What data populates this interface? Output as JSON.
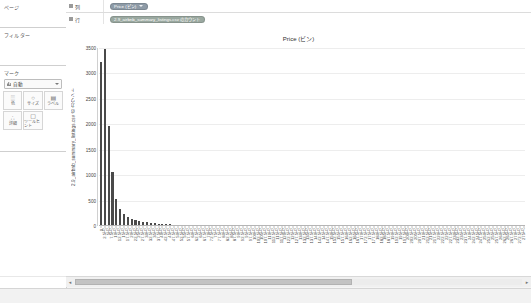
{
  "panels": {
    "pages": {
      "title": "ページ"
    },
    "filters": {
      "title": "フィルター"
    },
    "marks": {
      "title": "マーク",
      "type_label": "自動",
      "type_icon": "bar-mark-icon",
      "buttons": [
        {
          "icon": "color-icon",
          "glyph": "░",
          "label": "色"
        },
        {
          "icon": "size-icon",
          "glyph": "○",
          "label": "サイズ"
        },
        {
          "icon": "label-icon",
          "glyph": "▤",
          "label": "ラベル"
        },
        {
          "icon": "detail-icon",
          "glyph": "∴",
          "label": "詳細"
        },
        {
          "icon": "tooltip-icon",
          "glyph": "▢",
          "label": "ツールヒント"
        }
      ]
    }
  },
  "shelves": [
    {
      "name": "columns",
      "label": "列",
      "icon": "columns-icon",
      "pill": {
        "text": "Price (ビン)",
        "kind": "dim",
        "has_caret": true
      }
    },
    {
      "name": "rows",
      "label": "行",
      "icon": "rows-icon",
      "pill": {
        "text": "2.9_airbnb_summary_listings.csv のカウント",
        "kind": "mea",
        "has_caret": false
      }
    }
  ],
  "chart_data": {
    "type": "bar",
    "title": "Price (ビン)",
    "xlabel": "",
    "ylabel": "2.9_airbnb_summary_listings.csv のカウント",
    "ylim": [
      0,
      3500
    ],
    "yticks": [
      3500,
      3000,
      2500,
      2000,
      1500,
      1000,
      500,
      0
    ],
    "grid": true,
    "legend": null,
    "categories": [
      "0",
      "2.5万",
      "5万",
      "7.5万",
      "10万",
      "12.5万",
      "15万",
      "17.5万",
      "20万",
      "22.5万",
      "25万",
      "27.5万",
      "30万",
      "32.5万",
      "35万",
      "37.5万",
      "40万",
      "42.5万",
      "45万",
      "47.5万",
      "50万",
      "52.5万",
      "55万",
      "57.5万",
      "60万",
      "62.5万",
      "65万",
      "67.5万",
      "70万",
      "72.5万",
      "75万",
      "77.5万",
      "80万",
      "82.5万",
      "85万",
      "87.5万",
      "90万",
      "92.5万",
      "95万",
      "97.5万",
      "100万",
      "102.5万",
      "105万",
      "107.5万",
      "110万",
      "112.5万",
      "115万",
      "117.5万",
      "120万",
      "122.5万",
      "125万",
      "127.5万",
      "130万",
      "132.5万",
      "135万",
      "137.5万",
      "140万",
      "142.5万",
      "145万",
      "147.5万",
      "150万",
      "152.5万",
      "155万",
      "157.5万",
      "160万",
      "162.5万",
      "165万",
      "167.5万",
      "170万",
      "172.5万",
      "175万",
      "177.5万",
      "180万",
      "182.5万",
      "185万",
      "187.5万",
      "190万",
      "192.5万",
      "195万",
      "197.5万",
      "200万",
      "202.5万",
      "205万",
      "207.5万",
      "210万",
      "212.5万",
      "215万",
      "217.5万",
      "220万",
      "222.5万",
      "225万",
      "227.5万",
      "230万",
      "232.5万",
      "235万",
      "237.5万",
      "240万",
      "242.5万",
      "245万",
      "247.5万",
      "250万",
      "252.5万",
      "255万",
      "257.5万",
      "260万",
      "262.5万",
      "265万",
      "267.5万",
      "270万",
      "272.5万",
      "275万"
    ],
    "xtick_labels": [
      "0",
      "2.5万",
      "5万",
      "7.5万",
      "10万",
      "12.5万",
      "15万",
      "17.5万",
      "20万",
      "22.5万",
      "25万",
      "27.5万",
      "30万",
      "32.5万",
      "35万",
      "37.5万",
      "40万",
      "42.5万",
      "45万",
      "47.5万",
      "50万",
      "52.5万",
      "55万",
      "57.5万",
      "60万",
      "62.5万",
      "65万",
      "67.5万",
      "70万",
      "72.5万",
      "75万",
      "77.5万",
      "80万",
      "82.5万",
      "85万",
      "87.5万",
      "90万",
      "92.5万",
      "95万",
      "97.5万",
      "100万",
      "102.5万",
      "105万",
      "107.5万",
      "110万",
      "112.5万",
      "115万",
      "117.5万",
      "120万",
      "122.5万",
      "125万",
      "127.5万",
      "130万",
      "132.5万",
      "135万",
      "137.5万",
      "140万",
      "142.5万",
      "145万",
      "147.5万",
      "150万",
      "152.5万",
      "155万",
      "157.5万",
      "160万",
      "162.5万",
      "165万",
      "167.5万",
      "170万",
      "172.5万",
      "175万",
      "177.5万",
      "180万",
      "182.5万",
      "185万",
      "187.5万",
      "190万",
      "192.5万",
      "195万",
      "197.5万",
      "200万",
      "202.5万",
      "205万",
      "207.5万",
      "210万",
      "212.5万",
      "215万",
      "217.5万",
      "220万",
      "222.5万",
      "225万",
      "227.5万",
      "230万",
      "232.5万",
      "235万",
      "237.5万",
      "240万",
      "242.5万",
      "245万",
      "247.5万",
      "250万",
      "252.5万",
      "255万",
      "257.5万",
      "260万",
      "262.5万",
      "265万",
      "267.5万",
      "270万",
      "272.5万",
      "275万"
    ],
    "values": [
      3220,
      3490,
      1960,
      1060,
      540,
      330,
      230,
      175,
      140,
      110,
      95,
      80,
      70,
      60,
      52,
      45,
      40,
      34,
      30,
      27,
      24,
      21,
      19,
      17,
      15,
      14,
      12,
      11,
      10,
      9,
      8,
      8,
      7,
      6,
      6,
      5,
      5,
      5,
      4,
      4,
      4,
      3,
      3,
      3,
      3,
      3,
      2,
      2,
      2,
      2,
      2,
      2,
      2,
      2,
      2,
      1,
      1,
      1,
      1,
      1,
      1,
      1,
      1,
      1,
      1,
      1,
      1,
      1,
      1,
      1,
      1,
      1,
      1,
      1,
      1,
      1,
      1,
      1,
      1,
      1,
      1,
      1,
      1,
      1,
      1,
      1,
      1,
      1,
      1,
      1,
      1,
      1,
      1,
      1,
      1,
      1,
      1,
      1,
      1,
      1,
      1,
      1,
      1,
      1,
      1,
      1,
      1,
      1,
      1,
      1,
      1
    ]
  },
  "scrollbar": {
    "left_arrow": "◂",
    "right_arrow": "▸",
    "thumb_position_pct": 0,
    "thumb_width_pct": 62
  }
}
